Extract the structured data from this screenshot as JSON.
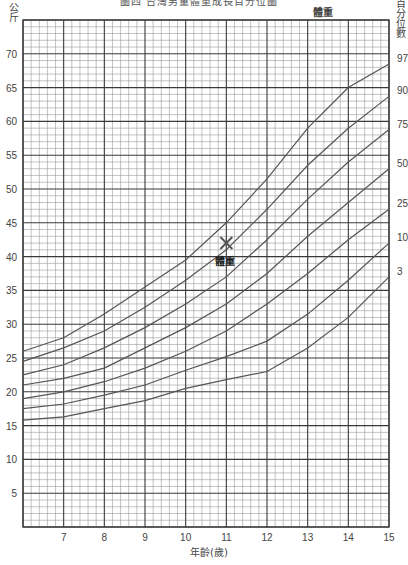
{
  "title": "圖四  台灣男童體重成長百分位圖",
  "y_unit_label": "公斤",
  "percentile_axis_label": "百分位數",
  "series_top_label": "體重",
  "x_axis_label": "年齡(歲)",
  "marker": {
    "label": "體重",
    "age": 11,
    "weight": 42,
    "symbol": "✕"
  },
  "colors": {
    "major_grid": "#3a3a3a",
    "minor_grid": "#9a9a9a",
    "curve": "#555555",
    "text": "#444444"
  },
  "chart_data": {
    "type": "line",
    "xlabel": "年齡(歲)",
    "ylabel": "公斤",
    "xlim": [
      6,
      15
    ],
    "ylim": [
      0,
      75
    ],
    "grid": true,
    "x_ticks": [
      7,
      8,
      9,
      10,
      11,
      12,
      13,
      14,
      15
    ],
    "y_ticks": [
      5,
      10,
      15,
      20,
      25,
      30,
      35,
      40,
      45,
      50,
      55,
      60,
      65,
      70
    ],
    "x": [
      6,
      7,
      8,
      9,
      10,
      11,
      12,
      13,
      14,
      15
    ],
    "series": [
      {
        "name": "97",
        "values": [
          26,
          28,
          31.5,
          35.5,
          39.5,
          45,
          51.5,
          59,
          65,
          68.5
        ]
      },
      {
        "name": "90",
        "values": [
          24.5,
          26.5,
          29,
          32.5,
          36.5,
          41,
          47,
          53.5,
          59,
          63.7
        ]
      },
      {
        "name": "75",
        "values": [
          22.5,
          24,
          26.5,
          29.5,
          33,
          37,
          42.5,
          48.5,
          54,
          58.8
        ]
      },
      {
        "name": "50",
        "values": [
          21,
          22,
          23.5,
          26.5,
          29.5,
          33,
          37.5,
          43,
          48,
          53
        ]
      },
      {
        "name": "25",
        "values": [
          19,
          20,
          21.5,
          23.5,
          26,
          29,
          33,
          37.5,
          42.5,
          47
        ]
      },
      {
        "name": "10",
        "values": [
          17.5,
          18.2,
          19.5,
          21,
          23.2,
          25.2,
          27.5,
          31.5,
          36.5,
          42
        ]
      },
      {
        "name": "3",
        "values": [
          15.8,
          16.3,
          17.5,
          18.7,
          20.5,
          21.8,
          23,
          26.5,
          31,
          37
        ]
      }
    ],
    "legend_position": "right",
    "annotations": [
      {
        "text": "體重",
        "x": 11,
        "y": 42,
        "marker": "x"
      }
    ]
  }
}
